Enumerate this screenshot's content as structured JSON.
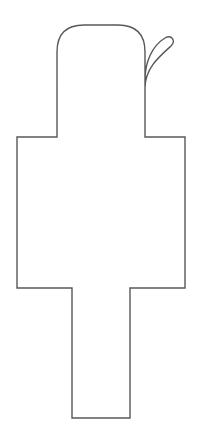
{
  "page": {
    "background_color": "#ffffff",
    "width": 202,
    "height": 439
  },
  "shape": {
    "name": "pushpin-outline",
    "description": "Symmetric outline drawing resembling a pushpin / thumbtack silhouette: rounded cap on top, S-curve taper to a narrow neck, wide rectangular body, narrower rectangular leg to the bottom",
    "stroke_color": "#585858",
    "fill_color": "#ffffff",
    "stroke_width": 1.4,
    "path": "M 57 88 L 57 52 Q 57 25 84 25 L 118 25 Q 145 25 145 52 L 145 88 C 145 68 160 56 171 46 C 176 41 172 34 165 38 C 152 46 145 62 145 80 L 145 137 L 185 137 L 185 288 L 130 288 L 130 418 L 72 418 L 72 288 L 17 288 L 17 137 L 57 137 Z",
    "geometry": {
      "head": {
        "top_y": 25,
        "left_x": 30,
        "right_x": 172,
        "widest_y": 42
      },
      "neck": {
        "left_x": 57,
        "right_x": 145,
        "top_y": 88,
        "bottom_y": 137
      },
      "body": {
        "left_x": 17,
        "right_x": 185,
        "top_y": 137,
        "bottom_y": 288
      },
      "leg": {
        "left_x": 72,
        "right_x": 130,
        "top_y": 288,
        "bottom_y": 418
      }
    }
  }
}
